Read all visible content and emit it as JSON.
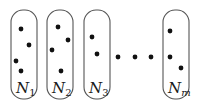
{
  "diagram": {
    "colors": {
      "stroke": "#555555",
      "dot": "#111111",
      "background": "#ffffff"
    },
    "boxes": [
      {
        "id": "N1",
        "label_main": "N",
        "label_sub": "1",
        "sub_italic": false,
        "x": 11,
        "dots": [
          [
            21,
            29
          ],
          [
            29,
            45
          ],
          [
            16,
            61
          ],
          [
            21,
            71
          ]
        ]
      },
      {
        "id": "N2",
        "label_main": "N",
        "label_sub": "2",
        "sub_italic": false,
        "x": 47,
        "dots": [
          [
            58,
            27
          ],
          [
            68,
            40
          ],
          [
            52,
            50
          ],
          [
            61,
            71
          ]
        ]
      },
      {
        "id": "N3",
        "label_main": "N",
        "label_sub": "3",
        "sub_italic": false,
        "x": 84,
        "dots": [
          [
            92,
            37
          ],
          [
            97,
            54
          ]
        ]
      },
      {
        "id": "Nm",
        "label_main": "N",
        "label_sub": "m",
        "sub_italic": true,
        "x": 163,
        "dots": [
          [
            170,
            31
          ],
          [
            170,
            57
          ],
          [
            181,
            68
          ]
        ]
      }
    ],
    "ellipsis_dots": [
      [
        118,
        57
      ],
      [
        135,
        57
      ],
      [
        151,
        57
      ]
    ]
  }
}
